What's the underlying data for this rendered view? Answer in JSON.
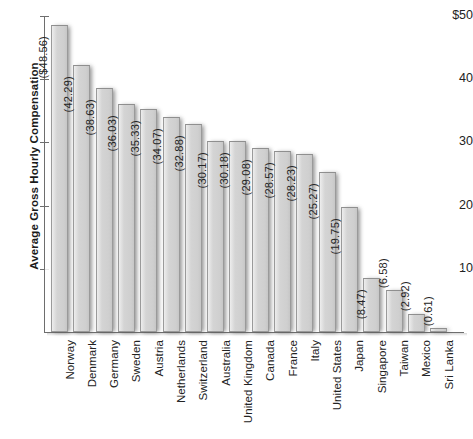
{
  "chart_data": {
    "type": "bar",
    "title": "",
    "xlabel": "",
    "ylabel": "Average Gross Hourly Compensation",
    "ylim": [
      0,
      50
    ],
    "yticks": [
      "$50",
      "40",
      "30",
      "20",
      "10"
    ],
    "ytick_values": [
      50,
      40,
      30,
      20,
      10
    ],
    "grid": false,
    "legend": "none",
    "orientation": "vertical",
    "categories": [
      "Norway",
      "Denmark",
      "Germany",
      "Sweden",
      "Austria",
      "Netherlands",
      "Switzerland",
      "Australia",
      "United Kingdom",
      "Canada",
      "France",
      "Italy",
      "United States",
      "Japan",
      "Singapore",
      "Taiwan",
      "Mexico",
      "Sri Lanka"
    ],
    "values": [
      48.56,
      42.29,
      38.63,
      36.03,
      35.33,
      34.07,
      32.88,
      30.17,
      30.18,
      29.08,
      28.57,
      28.23,
      25.27,
      19.75,
      8.47,
      6.58,
      2.92,
      0.61
    ],
    "data_labels": [
      "($48.56)",
      "(42.29)",
      "(38.63)",
      "(36.03)",
      "(35.33)",
      "(34.07)",
      "(32.88)",
      "(30.17)",
      "(30.18)",
      "(29.08)",
      "(28.57)",
      "(28.23)",
      "(25.27)",
      "(19.75)",
      "(8.47)",
      "(6.58)",
      "(2.92)",
      "(0.61)"
    ]
  },
  "style": {
    "bar_fill": "#d0d0d0",
    "bar_edge": "#9a9a9a",
    "axis_color": "#6e6e6e",
    "text_color": "#222222",
    "background": "#ffffff"
  }
}
